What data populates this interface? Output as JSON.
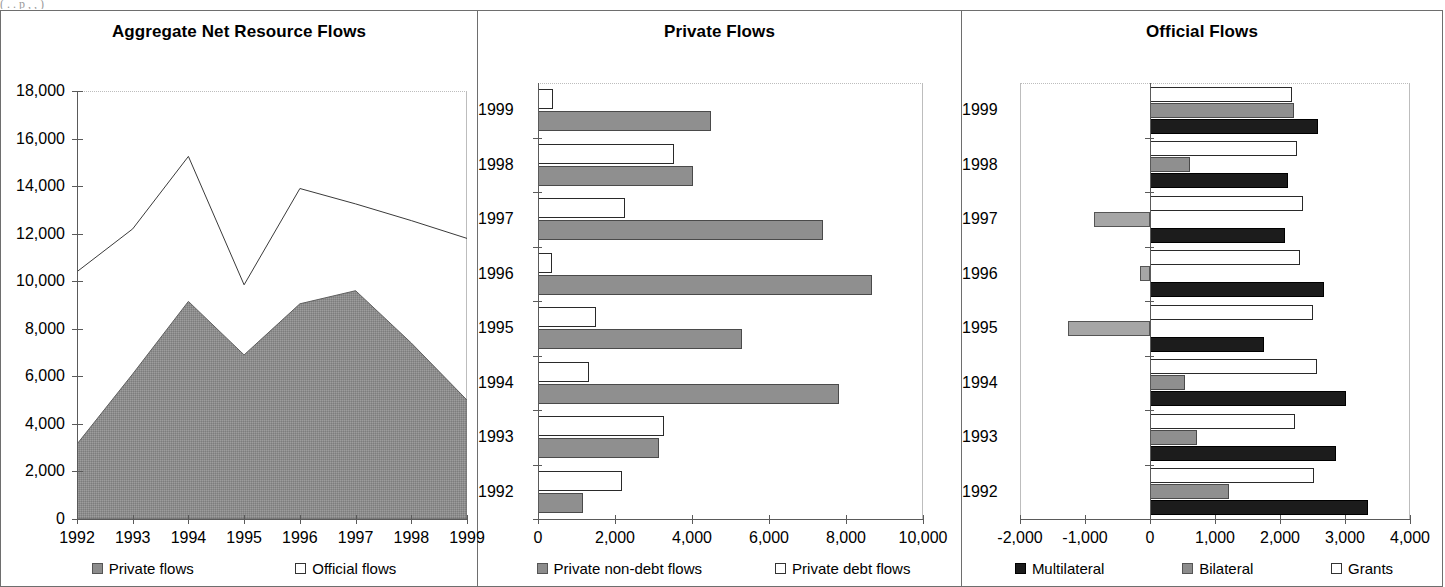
{
  "top_caption_fragment": "(  .    .   p      ,        ,          )",
  "panels": [
    {
      "title": "Aggregate Net Resource Flows",
      "legend": [
        {
          "label": "Private flows",
          "swatch": "gray"
        },
        {
          "label": "Official flows",
          "swatch": "white"
        }
      ]
    },
    {
      "title": "Private Flows",
      "legend": [
        {
          "label": "Private non-debt flows",
          "swatch": "gray"
        },
        {
          "label": "Private debt flows",
          "swatch": "white"
        }
      ]
    },
    {
      "title": "Official Flows",
      "legend": [
        {
          "label": "Multilateral",
          "swatch": "black"
        },
        {
          "label": "Bilateral",
          "swatch": "gray"
        },
        {
          "label": "Grants",
          "swatch": "white"
        }
      ]
    }
  ],
  "chart_data": [
    {
      "type": "area",
      "title": "Aggregate Net Resource Flows",
      "xlabel": "",
      "ylabel": "",
      "x": [
        "1992",
        "1993",
        "1994",
        "1995",
        "1996",
        "1997",
        "1998",
        "1999"
      ],
      "ylim": [
        0,
        18000
      ],
      "yticks": [
        "0",
        "2,000",
        "4,000",
        "6,000",
        "8,000",
        "10,000",
        "12,000",
        "14,000",
        "16,000",
        "18,000"
      ],
      "ytick_values": [
        0,
        2000,
        4000,
        6000,
        8000,
        10000,
        12000,
        14000,
        16000,
        18000
      ],
      "grid": false,
      "legend_position": "bottom",
      "series": [
        {
          "name": "Private flows",
          "render": "filled-area",
          "values": [
            3150,
            6100,
            9150,
            6900,
            9050,
            9600,
            7400,
            5000
          ]
        },
        {
          "name": "Official flows",
          "render": "line-total",
          "values": [
            10400,
            12200,
            15250,
            9850,
            13900,
            13250,
            12550,
            11800
          ]
        }
      ]
    },
    {
      "type": "bar",
      "orientation": "horizontal",
      "title": "Private Flows",
      "xlabel": "",
      "ylabel": "",
      "categories": [
        "1992",
        "1993",
        "1994",
        "1995",
        "1996",
        "1997",
        "1998",
        "1999"
      ],
      "xlim": [
        0,
        10000
      ],
      "xticks": [
        "0",
        "2,000",
        "4,000",
        "6,000",
        "8,000",
        "10,000"
      ],
      "xtick_values": [
        0,
        2000,
        4000,
        6000,
        8000,
        10000
      ],
      "grid": false,
      "legend_position": "bottom",
      "series": [
        {
          "name": "Private non-debt flows",
          "swatch": "gray",
          "values": [
            1180,
            3130,
            7820,
            5300,
            8680,
            7400,
            4020,
            4500
          ]
        },
        {
          "name": "Private debt flows",
          "swatch": "white",
          "values": [
            2180,
            3270,
            1330,
            1500,
            350,
            2270,
            3540,
            390
          ]
        }
      ]
    },
    {
      "type": "bar",
      "orientation": "horizontal",
      "title": "Official Flows",
      "xlabel": "",
      "ylabel": "",
      "categories": [
        "1992",
        "1993",
        "1994",
        "1995",
        "1996",
        "1997",
        "1998",
        "1999"
      ],
      "xlim": [
        -2000,
        4000
      ],
      "xticks": [
        "-2,000",
        "-1,000",
        "0",
        "1,000",
        "2,000",
        "3,000",
        "4,000"
      ],
      "xtick_values": [
        -2000,
        -1000,
        0,
        1000,
        2000,
        3000,
        4000
      ],
      "grid": false,
      "legend_position": "bottom",
      "series": [
        {
          "name": "Grants",
          "swatch": "white",
          "values": [
            2520,
            2230,
            2570,
            2500,
            2310,
            2350,
            2260,
            2180
          ]
        },
        {
          "name": "Bilateral",
          "swatch": "gray",
          "values": [
            1220,
            720,
            540,
            -1270,
            -150,
            -870,
            620,
            2220
          ]
        },
        {
          "name": "Multilateral",
          "swatch": "black",
          "values": [
            3350,
            2860,
            3010,
            1760,
            2680,
            2070,
            2120,
            2580
          ]
        }
      ]
    }
  ]
}
